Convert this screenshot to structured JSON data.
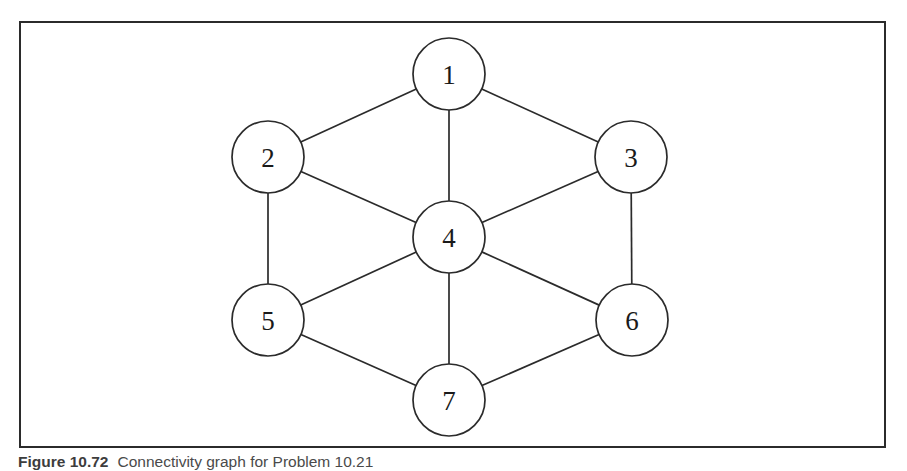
{
  "figure": {
    "caption_label": "Figure 10.72",
    "caption_text": "Connectivity graph for Problem 10.21",
    "frame_color": "#2b2b2b",
    "background_color": "#ffffff"
  },
  "chart_data": {
    "type": "diagram",
    "diagram_kind": "undirected-graph",
    "title": "Connectivity graph for Problem 10.21",
    "node_radius": 36,
    "nodes": [
      {
        "id": "1",
        "label": "1",
        "cx": 449,
        "cy": 74
      },
      {
        "id": "2",
        "label": "2",
        "cx": 268,
        "cy": 157
      },
      {
        "id": "3",
        "label": "3",
        "cx": 631,
        "cy": 157
      },
      {
        "id": "4",
        "label": "4",
        "cx": 449,
        "cy": 237
      },
      {
        "id": "5",
        "label": "5",
        "cx": 268,
        "cy": 320
      },
      {
        "id": "6",
        "label": "6",
        "cx": 632,
        "cy": 320
      },
      {
        "id": "7",
        "label": "7",
        "cx": 449,
        "cy": 400
      }
    ],
    "edges": [
      {
        "from": "1",
        "to": "2"
      },
      {
        "from": "1",
        "to": "3"
      },
      {
        "from": "1",
        "to": "4"
      },
      {
        "from": "2",
        "to": "4"
      },
      {
        "from": "2",
        "to": "5"
      },
      {
        "from": "3",
        "to": "4"
      },
      {
        "from": "3",
        "to": "6"
      },
      {
        "from": "4",
        "to": "5"
      },
      {
        "from": "4",
        "to": "6"
      },
      {
        "from": "4",
        "to": "7"
      },
      {
        "from": "5",
        "to": "7"
      },
      {
        "from": "6",
        "to": "7"
      }
    ],
    "edge_count": 12,
    "node_count": 7,
    "degrees": {
      "1": 3,
      "2": 3,
      "3": 3,
      "4": 6,
      "5": 3,
      "6": 3,
      "7": 3
    }
  }
}
